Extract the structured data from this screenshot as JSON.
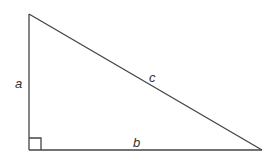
{
  "diagram": {
    "type": "right-triangle",
    "labels": {
      "vertical_side": "a",
      "horizontal_side": "b",
      "hypotenuse": "c"
    },
    "right_angle_marker": true,
    "colors": {
      "stroke": "#444444",
      "text": "#333333",
      "background": "#ffffff"
    }
  }
}
